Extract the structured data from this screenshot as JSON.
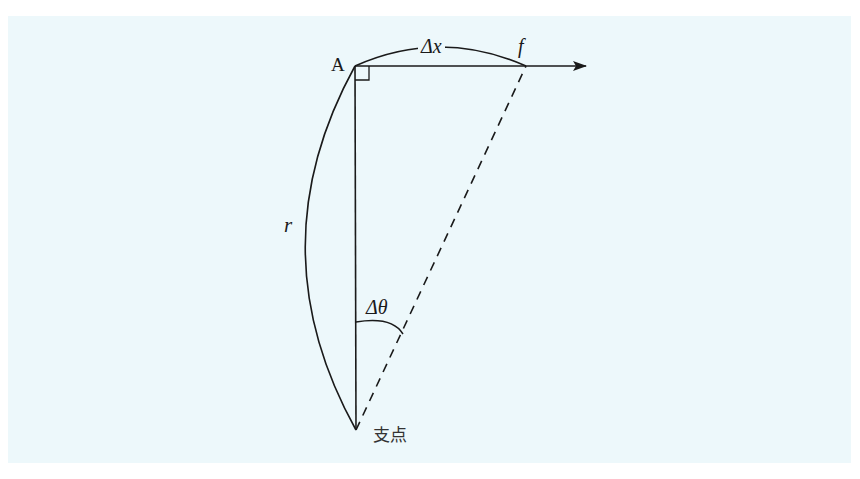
{
  "diagram": {
    "type": "pendulum-arc-geometry",
    "background_color": "#edf8fb",
    "stroke_color": "#1a1a1a",
    "labels": {
      "point_a": "A",
      "arc_length": "Δx",
      "force": "f",
      "radius": "r",
      "angle": "Δθ",
      "pivot": "支点"
    },
    "points": {
      "A": [
        355,
        66
      ],
      "f": [
        526,
        66
      ],
      "pivot": [
        356,
        430
      ],
      "arrow_tip": [
        586,
        66
      ]
    },
    "elements": [
      {
        "kind": "line",
        "from": "A",
        "to": "arrow_tip",
        "arrow": true,
        "label": "tangent direction"
      },
      {
        "kind": "line",
        "from": "A",
        "to": "pivot",
        "style": "solid",
        "label": "vertical radius"
      },
      {
        "kind": "line",
        "from": "pivot",
        "to": "f",
        "style": "dashed",
        "label": "displaced radius"
      },
      {
        "kind": "arc",
        "from": "A",
        "to": "f",
        "label": "Δx"
      },
      {
        "kind": "arc",
        "from": "A",
        "to": "pivot",
        "label": "r"
      },
      {
        "kind": "angle-arc",
        "at": "pivot",
        "label": "Δθ"
      },
      {
        "kind": "right-angle-marker",
        "at": "A"
      }
    ]
  }
}
